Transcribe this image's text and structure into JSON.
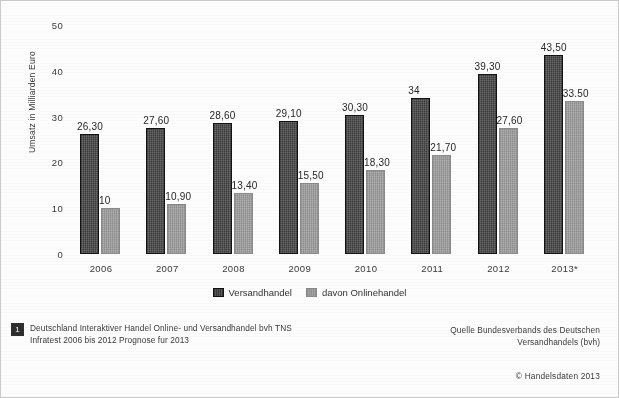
{
  "chart_data": {
    "type": "bar",
    "title": "",
    "xlabel": "",
    "ylabel": "Umsatz in Milliarden Euro",
    "categories": [
      "2006",
      "2007",
      "2008",
      "2009",
      "2010",
      "2011",
      "2012",
      "2013*"
    ],
    "series": [
      {
        "name": "Versandhandel",
        "color": "#3c3c3c",
        "values": [
          26.3,
          27.6,
          28.6,
          29.1,
          30.3,
          34,
          39.3,
          43.5
        ],
        "labels": [
          "26,30",
          "27,60",
          "28,60",
          "29,10",
          "30,30",
          "34",
          "39,30",
          "43,50"
        ]
      },
      {
        "name": "davon Onlinehandel",
        "color": "#9a9a9a",
        "values": [
          10,
          10.9,
          13.4,
          15.5,
          18.3,
          21.7,
          27.6,
          33.5
        ],
        "labels": [
          "10",
          "10,90",
          "13,40",
          "15,50",
          "18,30",
          "21,70",
          "27,60",
          "33.50"
        ]
      }
    ],
    "ylim": [
      0,
      50
    ],
    "yticks": [
      "0",
      "10",
      "20",
      "30",
      "40",
      "50"
    ],
    "grid": false,
    "legend_position": "bottom"
  },
  "footnote": {
    "marker": "1",
    "text": "Deutschland Interaktiver Handel Online- und Versandhandel bvh TNS Infratest 2006 bis 2012 Prognose fur 2013"
  },
  "source": {
    "line1": "Quelle Bundesverbands des Deutschen",
    "line2": "Versandhandels (bvh)"
  },
  "copyright": "© Handelsdaten 2013"
}
